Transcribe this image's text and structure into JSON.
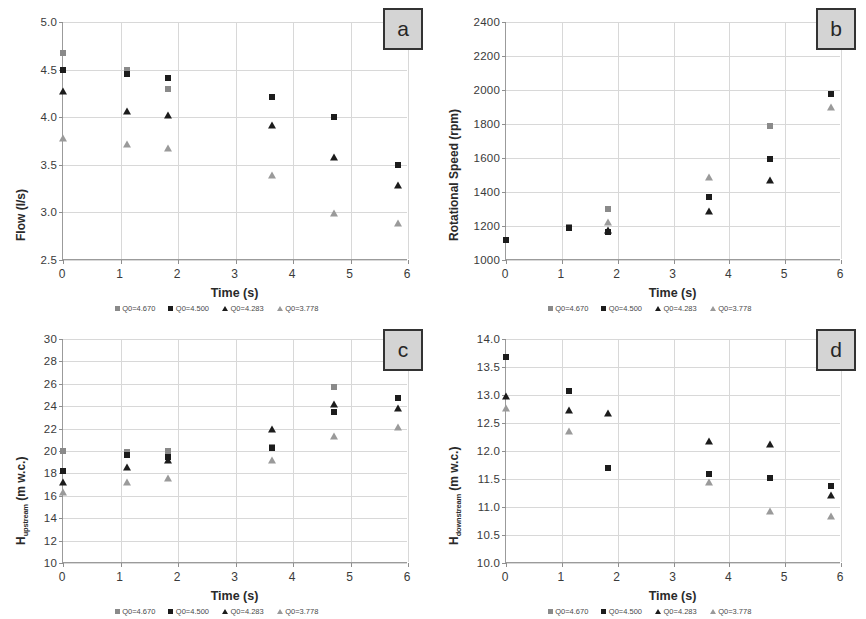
{
  "figure": {
    "panels": [
      "a",
      "b",
      "c",
      "d"
    ],
    "series_colors": {
      "Q0=4.670": "#8a8a8a",
      "Q0=4.500": "#1c1c1c",
      "Q0=4.283": "#1c1c1c",
      "Q0=3.778": "#9a9a9a"
    },
    "legend_labels": [
      "Q0=4.670",
      "Q0=4.500",
      "Q0=4.283",
      "Q0=3.778"
    ],
    "xlabel": "Time (s)"
  },
  "chart_data": [
    {
      "type": "scatter",
      "panel": "a",
      "title": "a",
      "xlabel": "Time (s)",
      "ylabel": "Flow (l/s)",
      "ylabel_base": "Flow",
      "ylabel_sub": "",
      "ylabel_unit": "(l/s)",
      "xlim": [
        0,
        6
      ],
      "ylim": [
        2.5,
        5.0
      ],
      "xticks": [
        0,
        1,
        2,
        3,
        4,
        5,
        6
      ],
      "yticks": [
        2.5,
        3.0,
        3.5,
        4.0,
        4.5,
        5.0
      ],
      "ytick_labels": [
        "2.5",
        "3.0",
        "3.5",
        "4.0",
        "4.5",
        "5.0"
      ],
      "grid": true,
      "legend_position": "below",
      "series": [
        {
          "name": "Q0=4.670",
          "marker": "square",
          "color": "#8a8a8a",
          "x": [
            0.0,
            1.12,
            1.82
          ],
          "y": [
            4.67,
            4.5,
            4.3
          ]
        },
        {
          "name": "Q0=4.500",
          "marker": "square",
          "color": "#1c1c1c",
          "x": [
            0.0,
            1.12,
            1.82,
            3.63,
            4.72,
            5.82
          ],
          "y": [
            4.5,
            4.45,
            4.41,
            4.21,
            4.0,
            3.5
          ]
        },
        {
          "name": "Q0=4.283",
          "marker": "triangle",
          "color": "#1c1c1c",
          "x": [
            0.0,
            1.12,
            1.82,
            3.63,
            4.72,
            5.82
          ],
          "y": [
            4.28,
            4.06,
            4.02,
            3.92,
            3.58,
            3.29
          ]
        },
        {
          "name": "Q0=3.778",
          "marker": "triangle",
          "color": "#9a9a9a",
          "x": [
            0.0,
            1.12,
            1.82,
            3.63,
            4.72,
            5.82
          ],
          "y": [
            3.78,
            3.72,
            3.68,
            3.39,
            2.99,
            2.89
          ]
        }
      ]
    },
    {
      "type": "scatter",
      "panel": "b",
      "title": "b",
      "xlabel": "Time (s)",
      "ylabel": "Rotational Speed (rpm)",
      "ylabel_base": "Rotational Speed",
      "ylabel_sub": "",
      "ylabel_unit": "(rpm)",
      "xlim": [
        0,
        6
      ],
      "ylim": [
        1000,
        2400
      ],
      "xticks": [
        0,
        1,
        2,
        3,
        4,
        5,
        6
      ],
      "yticks": [
        1000,
        1200,
        1400,
        1600,
        1800,
        2000,
        2200,
        2400
      ],
      "ytick_labels": [
        "1000",
        "1200",
        "1400",
        "1600",
        "1800",
        "2000",
        "2200",
        "2400"
      ],
      "grid": true,
      "legend_position": "below",
      "series": [
        {
          "name": "Q0=4.670",
          "marker": "square",
          "color": "#8a8a8a",
          "x": [
            0.0,
            1.12,
            1.82,
            4.72
          ],
          "y": [
            1120,
            1195,
            1300,
            1790
          ]
        },
        {
          "name": "Q0=4.500",
          "marker": "square",
          "color": "#1c1c1c",
          "x": [
            0.0,
            1.12,
            1.82,
            3.63,
            4.72,
            5.82
          ],
          "y": [
            1120,
            1190,
            1165,
            1370,
            1595,
            1975
          ]
        },
        {
          "name": "Q0=4.283",
          "marker": "triangle",
          "color": "#1c1c1c",
          "x": [
            1.82,
            3.63,
            4.72
          ],
          "y": [
            1175,
            1290,
            1470
          ]
        },
        {
          "name": "Q0=3.778",
          "marker": "triangle",
          "color": "#9a9a9a",
          "x": [
            1.82,
            3.63,
            5.82
          ],
          "y": [
            1225,
            1490,
            1900
          ]
        }
      ]
    },
    {
      "type": "scatter",
      "panel": "c",
      "title": "c",
      "xlabel": "Time (s)",
      "ylabel": "H_upstream (m w.c.)",
      "ylabel_base": "H",
      "ylabel_sub": "upstream",
      "ylabel_unit": "(m w.c.)",
      "xlim": [
        0,
        6
      ],
      "ylim": [
        10,
        30
      ],
      "xticks": [
        0,
        1,
        2,
        3,
        4,
        5,
        6
      ],
      "yticks": [
        10,
        12,
        14,
        16,
        18,
        20,
        22,
        24,
        26,
        28,
        30
      ],
      "ytick_labels": [
        "10",
        "12",
        "14",
        "16",
        "18",
        "20",
        "22",
        "24",
        "26",
        "28",
        "30"
      ],
      "grid": true,
      "legend_position": "below",
      "series": [
        {
          "name": "Q0=4.670",
          "marker": "square",
          "color": "#8a8a8a",
          "x": [
            0.0,
            1.12,
            1.82,
            3.63,
            4.72
          ],
          "y": [
            20.0,
            19.9,
            20.0,
            20.4,
            25.7
          ]
        },
        {
          "name": "Q0=4.500",
          "marker": "square",
          "color": "#1c1c1c",
          "x": [
            0.0,
            1.12,
            1.82,
            3.63,
            4.72,
            5.82
          ],
          "y": [
            18.2,
            19.6,
            19.5,
            20.3,
            23.5,
            24.7
          ]
        },
        {
          "name": "Q0=4.283",
          "marker": "triangle",
          "color": "#1c1c1c",
          "x": [
            0.0,
            1.12,
            1.82,
            3.63,
            4.72,
            5.82
          ],
          "y": [
            17.2,
            18.6,
            19.2,
            22.0,
            24.2,
            23.8
          ]
        },
        {
          "name": "Q0=3.778",
          "marker": "triangle",
          "color": "#9a9a9a",
          "x": [
            0.0,
            1.12,
            1.82,
            3.63,
            4.72,
            5.82
          ],
          "y": [
            16.3,
            17.2,
            17.6,
            19.2,
            21.3,
            22.1
          ]
        }
      ]
    },
    {
      "type": "scatter",
      "panel": "d",
      "title": "d",
      "xlabel": "Time (s)",
      "ylabel": "H_downstream (m w.c.)",
      "ylabel_base": "H",
      "ylabel_sub": "downstream",
      "ylabel_unit": "(m w.c.)",
      "xlim": [
        0,
        6
      ],
      "ylim": [
        10.0,
        14.0
      ],
      "xticks": [
        0,
        1,
        2,
        3,
        4,
        5,
        6
      ],
      "yticks": [
        10.0,
        10.5,
        11.0,
        11.5,
        12.0,
        12.5,
        13.0,
        13.5,
        14.0
      ],
      "ytick_labels": [
        "10.0",
        "10.5",
        "11.0",
        "11.5",
        "12.0",
        "12.5",
        "13.0",
        "13.5",
        "14.0"
      ],
      "grid": true,
      "legend_position": "below",
      "series": [
        {
          "name": "Q0=4.670",
          "marker": "square",
          "color": "#8a8a8a",
          "x": [
            1.82
          ],
          "y": [
            11.7
          ]
        },
        {
          "name": "Q0=4.500",
          "marker": "square",
          "color": "#1c1c1c",
          "x": [
            0.0,
            1.12,
            1.82,
            3.63,
            4.72,
            5.82
          ],
          "y": [
            13.68,
            13.07,
            11.69,
            11.59,
            11.52,
            11.38
          ]
        },
        {
          "name": "Q0=4.283",
          "marker": "triangle",
          "color": "#1c1c1c",
          "x": [
            0.0,
            1.12,
            1.82,
            3.63,
            4.72,
            5.82
          ],
          "y": [
            12.99,
            12.73,
            12.68,
            12.17,
            12.12,
            11.21
          ]
        },
        {
          "name": "Q0=3.778",
          "marker": "triangle",
          "color": "#9a9a9a",
          "x": [
            0.0,
            1.12,
            3.63,
            4.72,
            5.82
          ],
          "y": [
            12.77,
            12.35,
            11.44,
            10.92,
            10.84
          ]
        }
      ]
    }
  ]
}
